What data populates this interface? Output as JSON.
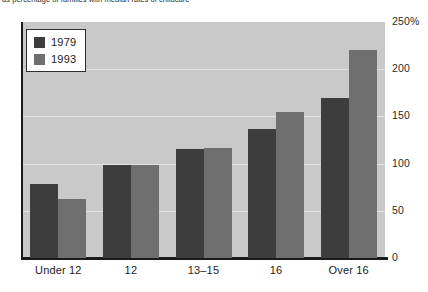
{
  "caption": "as percentage of families with median rates of childcare",
  "chart_data": {
    "type": "bar",
    "title": "",
    "subtitle": "",
    "xlabel": "",
    "ylabel": "",
    "categories": [
      "Under 12",
      "12",
      "13–15",
      "16",
      "Over 16"
    ],
    "series": [
      {
        "name": "1979",
        "color": "#3d3d3d",
        "values": [
          78,
          99,
          115,
          137,
          170
        ]
      },
      {
        "name": "1993",
        "color": "#6f6f6f",
        "values": [
          62,
          99,
          117,
          155,
          220
        ]
      }
    ],
    "ylim": [
      0,
      250
    ],
    "ytick_values": [
      250,
      200,
      150,
      100,
      50,
      0
    ],
    "ytick_labels": [
      "250%",
      "200",
      "150",
      "100",
      "50",
      "0"
    ],
    "grid": true,
    "grid_axis": "y",
    "legend_position": "top-left",
    "plot_background": "#c9c9c9",
    "gridline_color": "#e2e2e2",
    "axis_color": "#1b1b1b"
  }
}
